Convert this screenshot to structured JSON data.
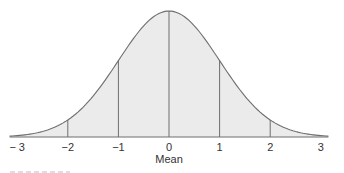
{
  "chart_data": {
    "type": "area",
    "title": "",
    "x_ticks": [
      -3,
      -2,
      -1,
      0,
      1,
      2,
      3
    ],
    "tick_labels": [
      "− 3",
      "−2",
      "−1",
      "0",
      "1",
      "2",
      "3"
    ],
    "xlabel": "Mean",
    "ylabel": "",
    "xlim": [
      -3,
      3
    ],
    "vertical_lines_at": [
      -2,
      -1,
      0,
      1,
      2
    ],
    "grid": false,
    "legend": null,
    "colors": {
      "fill": "#ebebeb",
      "stroke": "#6e6e6e",
      "axis": "#6e6e6e",
      "text": "#333333"
    }
  },
  "layout": {
    "baseline_y": 137,
    "peak_y": 11,
    "x0_px": 169,
    "px_per_unit": 50.6
  }
}
